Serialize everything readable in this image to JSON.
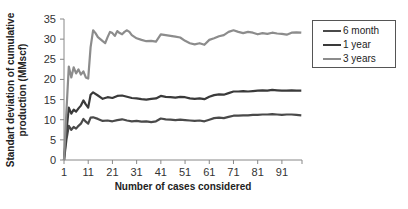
{
  "chart_data": {
    "type": "line",
    "title": "",
    "xlabel": "Number of cases considered",
    "ylabel": "Standart deviation of cumulative production (MMscf)",
    "ylabel_lines": [
      "Standart deviation  of cumulative",
      "production (MMscf)"
    ],
    "ylim": [
      0,
      35
    ],
    "yticks": [
      0,
      5,
      10,
      15,
      20,
      25,
      30,
      35
    ],
    "xlim": [
      1,
      100
    ],
    "xticks": [
      1,
      11,
      21,
      31,
      41,
      51,
      61,
      71,
      81,
      91
    ],
    "grid": false,
    "legend_position": "right",
    "series": [
      {
        "name": "6 month",
        "color": "#4a4a4a",
        "points": [
          [
            1,
            0
          ],
          [
            2,
            5
          ],
          [
            3,
            8.5
          ],
          [
            4,
            7.5
          ],
          [
            5,
            8.2
          ],
          [
            6,
            7.8
          ],
          [
            7,
            8.5
          ],
          [
            8,
            9
          ],
          [
            9,
            10.2
          ],
          [
            10,
            9.5
          ],
          [
            11,
            9
          ],
          [
            12,
            10.5
          ],
          [
            13,
            10.6
          ],
          [
            15,
            10.2
          ],
          [
            17,
            9.7
          ],
          [
            19,
            9.8
          ],
          [
            21,
            9.6
          ],
          [
            23,
            9.9
          ],
          [
            25,
            10.1
          ],
          [
            27,
            9.8
          ],
          [
            29,
            9.6
          ],
          [
            31,
            9.7
          ],
          [
            33,
            9.5
          ],
          [
            35,
            9.6
          ],
          [
            37,
            9.4
          ],
          [
            39,
            9.6
          ],
          [
            41,
            10.3
          ],
          [
            43,
            10.1
          ],
          [
            45,
            10
          ],
          [
            47,
            9.9
          ],
          [
            49,
            10
          ],
          [
            51,
            9.9
          ],
          [
            53,
            9.8
          ],
          [
            55,
            9.7
          ],
          [
            57,
            9.8
          ],
          [
            59,
            9.6
          ],
          [
            61,
            10
          ],
          [
            63,
            10.4
          ],
          [
            65,
            10.5
          ],
          [
            67,
            10.4
          ],
          [
            69,
            10.7
          ],
          [
            71,
            11
          ],
          [
            73,
            11
          ],
          [
            75,
            11.1
          ],
          [
            77,
            11.1
          ],
          [
            79,
            11.2
          ],
          [
            81,
            11.2
          ],
          [
            83,
            11.3
          ],
          [
            85,
            11.3
          ],
          [
            87,
            11.4
          ],
          [
            89,
            11.3
          ],
          [
            91,
            11.2
          ],
          [
            93,
            11.3
          ],
          [
            95,
            11.3
          ],
          [
            97,
            11.2
          ],
          [
            99,
            11.1
          ]
        ]
      },
      {
        "name": "1 year",
        "color": "#3a3a3a",
        "points": [
          [
            1,
            0
          ],
          [
            2,
            7
          ],
          [
            3,
            13
          ],
          [
            4,
            11.5
          ],
          [
            5,
            12.5
          ],
          [
            6,
            12
          ],
          [
            7,
            12.8
          ],
          [
            8,
            13.5
          ],
          [
            9,
            14.8
          ],
          [
            10,
            13.8
          ],
          [
            11,
            13
          ],
          [
            12,
            16.2
          ],
          [
            13,
            16.8
          ],
          [
            15,
            16
          ],
          [
            17,
            15.2
          ],
          [
            19,
            15.6
          ],
          [
            21,
            15.4
          ],
          [
            23,
            15.9
          ],
          [
            25,
            16
          ],
          [
            27,
            15.7
          ],
          [
            29,
            15.4
          ],
          [
            31,
            15.3
          ],
          [
            33,
            15.1
          ],
          [
            35,
            15
          ],
          [
            37,
            15.2
          ],
          [
            39,
            15.3
          ],
          [
            41,
            15.9
          ],
          [
            43,
            15.7
          ],
          [
            45,
            15.6
          ],
          [
            47,
            15.5
          ],
          [
            49,
            15.7
          ],
          [
            51,
            15.6
          ],
          [
            53,
            15.3
          ],
          [
            55,
            15.2
          ],
          [
            57,
            15.3
          ],
          [
            59,
            15.1
          ],
          [
            61,
            15.7
          ],
          [
            63,
            16.1
          ],
          [
            65,
            16.3
          ],
          [
            67,
            16.2
          ],
          [
            69,
            16.6
          ],
          [
            71,
            17
          ],
          [
            73,
            17
          ],
          [
            75,
            17.1
          ],
          [
            77,
            17
          ],
          [
            79,
            17.1
          ],
          [
            81,
            17.2
          ],
          [
            83,
            17.3
          ],
          [
            85,
            17.2
          ],
          [
            87,
            17.4
          ],
          [
            89,
            17.3
          ],
          [
            91,
            17.2
          ],
          [
            93,
            17.2
          ],
          [
            95,
            17.3
          ],
          [
            97,
            17.2
          ],
          [
            99,
            17.2
          ]
        ]
      },
      {
        "name": "3 years",
        "color": "#8c8c8c",
        "points": [
          [
            1,
            0
          ],
          [
            2,
            12
          ],
          [
            3,
            23.2
          ],
          [
            4,
            20.5
          ],
          [
            5,
            23
          ],
          [
            6,
            21.5
          ],
          [
            7,
            22.5
          ],
          [
            8,
            21.2
          ],
          [
            9,
            22
          ],
          [
            10,
            20.5
          ],
          [
            11,
            20.2
          ],
          [
            12,
            28
          ],
          [
            13,
            32.2
          ],
          [
            14,
            31.5
          ],
          [
            15,
            30.5
          ],
          [
            16,
            30
          ],
          [
            17,
            29.5
          ],
          [
            18,
            29
          ],
          [
            19,
            30.5
          ],
          [
            20,
            31.8
          ],
          [
            21,
            31.5
          ],
          [
            22,
            30.8
          ],
          [
            23,
            32
          ],
          [
            24,
            31.5
          ],
          [
            25,
            31.2
          ],
          [
            26,
            31.8
          ],
          [
            27,
            32.2
          ],
          [
            28,
            31.8
          ],
          [
            29,
            31
          ],
          [
            31,
            30.2
          ],
          [
            33,
            29.8
          ],
          [
            35,
            29.5
          ],
          [
            37,
            29.6
          ],
          [
            39,
            29.4
          ],
          [
            41,
            31.2
          ],
          [
            43,
            31
          ],
          [
            45,
            30.8
          ],
          [
            47,
            30.6
          ],
          [
            49,
            30.4
          ],
          [
            51,
            29.6
          ],
          [
            53,
            29
          ],
          [
            55,
            28.7
          ],
          [
            57,
            29
          ],
          [
            59,
            28.6
          ],
          [
            61,
            29.8
          ],
          [
            63,
            30.2
          ],
          [
            65,
            30.7
          ],
          [
            67,
            31
          ],
          [
            69,
            31.8
          ],
          [
            71,
            32.2
          ],
          [
            73,
            31.8
          ],
          [
            75,
            31.5
          ],
          [
            77,
            31.8
          ],
          [
            79,
            31.6
          ],
          [
            81,
            31.2
          ],
          [
            83,
            31.5
          ],
          [
            85,
            31.3
          ],
          [
            87,
            31.6
          ],
          [
            89,
            31.4
          ],
          [
            91,
            31.3
          ],
          [
            93,
            31.1
          ],
          [
            95,
            31.6
          ],
          [
            97,
            31.7
          ],
          [
            99,
            31.6
          ]
        ]
      }
    ]
  },
  "legend": {
    "items": [
      {
        "label": "6 month",
        "color": "#4a4a4a"
      },
      {
        "label": "1 year",
        "color": "#3a3a3a"
      },
      {
        "label": "3 years",
        "color": "#8c8c8c"
      }
    ]
  }
}
